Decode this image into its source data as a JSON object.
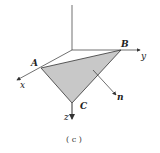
{
  "figure": {
    "caption": "( c )",
    "points": {
      "A": "A",
      "B": "B",
      "C": "C"
    },
    "axes": {
      "x": "x",
      "y": "y",
      "z": "z"
    },
    "normal": "n",
    "colors": {
      "triangle_fill": "#c8c8c8",
      "lines": "#333333"
    }
  }
}
